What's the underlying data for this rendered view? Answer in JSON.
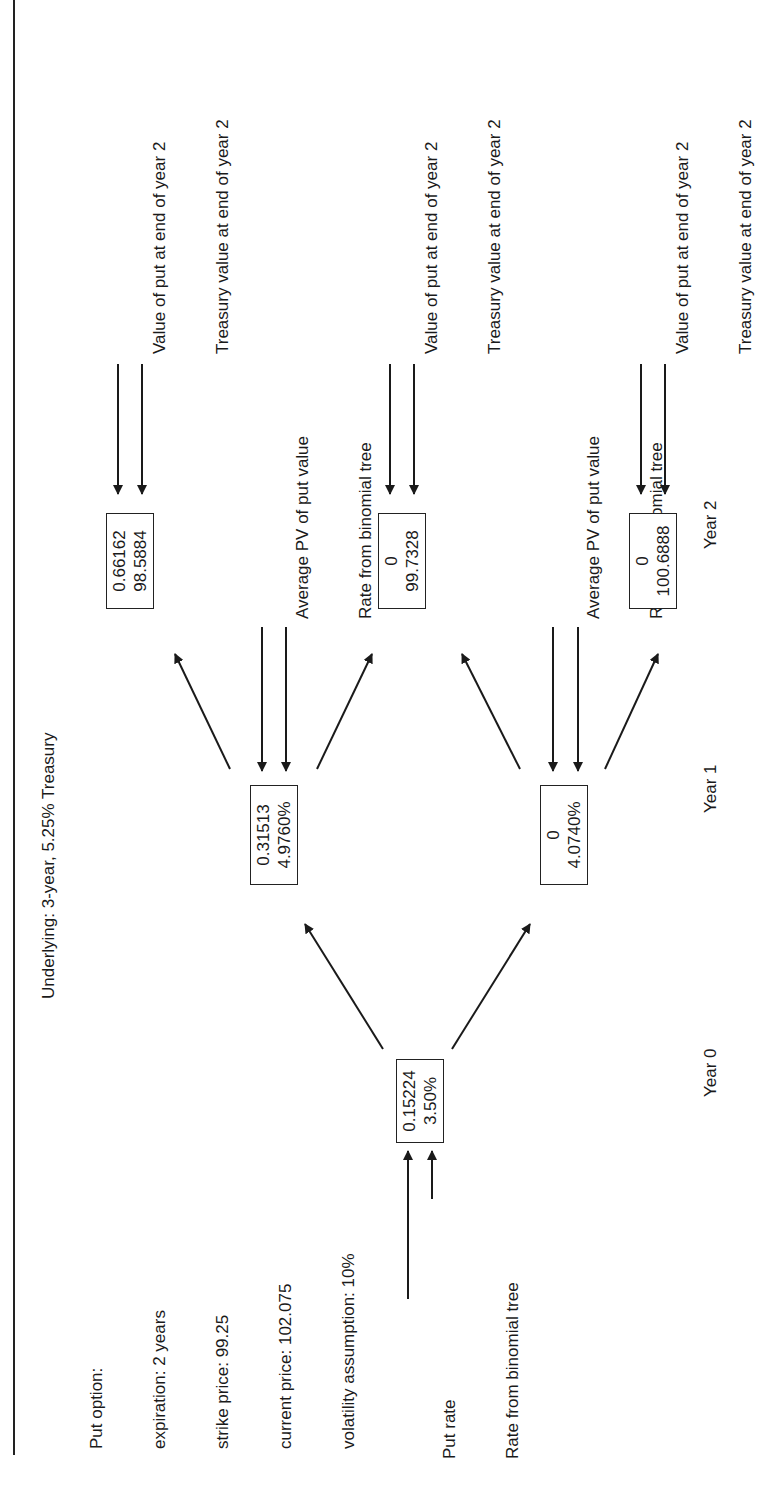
{
  "orientation": "rotated-90-ccw",
  "header": {
    "put_option": {
      "title": "Put option:",
      "lines": [
        "expiration: 2 years",
        "strike price: 99.25",
        "current price: 102.075",
        "volatility assumption: 10%"
      ]
    },
    "underlying": "Underlying: 3-year, 5.25% Treasury"
  },
  "nodes": {
    "year0": {
      "put": "0.15224",
      "rate": "3.50%"
    },
    "year1_up": {
      "put": "0.31513",
      "rate": "4.9760%"
    },
    "year1_down": {
      "put": "0",
      "rate": "4.0740%"
    },
    "year2_upup": {
      "put": "0.66162",
      "treasury": "98.5884"
    },
    "year2_mid": {
      "put": "0",
      "treasury": "99.7328"
    },
    "year2_downdown": {
      "put": "0",
      "treasury": "100.6888"
    }
  },
  "labels": {
    "year0_legend": {
      "line1": "Put rate",
      "line2": "Rate from binomial tree"
    },
    "year1_legend": {
      "line1": "Average PV of put value",
      "line2": "Rate from binomial tree"
    },
    "year2_legend": {
      "line1": "Value of put at end of year 2",
      "line2": "Treasury value at end of year 2"
    }
  },
  "axis": {
    "years": [
      "Year 0",
      "Year 1",
      "Year 2"
    ]
  },
  "colors": {
    "ink": "#1a1a1a",
    "background": "#ffffff"
  }
}
